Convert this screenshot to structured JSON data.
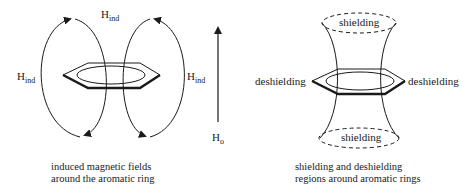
{
  "left_panel": {
    "field_label": "H",
    "field_sub": "ind",
    "external_label": "H",
    "external_sub": "o",
    "caption_line1": "induced magnetic fields",
    "caption_line2": "around the aromatic ring"
  },
  "right_panel": {
    "shielding_top": "shielding",
    "shielding_bottom": "shielding",
    "deshielding_left": "deshielding",
    "deshielding_right": "deshielding",
    "caption_line1": "shielding and deshielding",
    "caption_line2": "regions around aromatic rings"
  },
  "colors": {
    "line": "#1a1a1a",
    "background": "#ffffff"
  }
}
